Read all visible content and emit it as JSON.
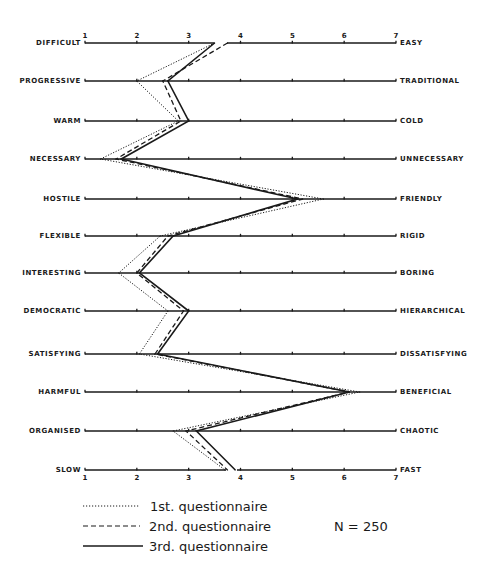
{
  "chart_data": {
    "type": "line",
    "title": "",
    "xlabel": "",
    "ylabel": "",
    "orientation": "semantic-differential",
    "scale": {
      "min": 1,
      "max": 7,
      "ticks": [
        "1",
        "2",
        "3",
        "4",
        "5",
        "6",
        "7"
      ]
    },
    "items": [
      {
        "left": "DIFFICULT",
        "right": "EASY"
      },
      {
        "left": "PROGRESSIVE",
        "right": "TRADITIONAL"
      },
      {
        "left": "WARM",
        "right": "COLD"
      },
      {
        "left": "NECESSARY",
        "right": "UNNECESSARY"
      },
      {
        "left": "HOSTILE",
        "right": "FRIENDLY"
      },
      {
        "left": "FLEXIBLE",
        "right": "RIGID"
      },
      {
        "left": "INTERESTING",
        "right": "BORING"
      },
      {
        "left": "DEMOCRATIC",
        "right": "HIERARCHICAL"
      },
      {
        "left": "SATISFYING",
        "right": "DISSATISFYING"
      },
      {
        "left": "HARMFUL",
        "right": "BENEFICIAL"
      },
      {
        "left": "ORGANISED",
        "right": "CHAOTIC"
      },
      {
        "left": "SLOW",
        "right": "FAST"
      }
    ],
    "series": [
      {
        "name": "1st. questionnaire",
        "style": "dotted",
        "values": [
          3.5,
          2.0,
          2.8,
          1.3,
          5.6,
          2.45,
          1.65,
          2.6,
          2.05,
          6.3,
          2.7,
          3.7
        ]
      },
      {
        "name": "2nd. questionnaire",
        "style": "dashed",
        "values": [
          3.75,
          2.5,
          2.85,
          1.6,
          5.2,
          2.6,
          2.0,
          2.9,
          2.35,
          6.1,
          2.95,
          3.75
        ]
      },
      {
        "name": "3rd. questionnaire",
        "style": "solid",
        "values": [
          3.5,
          2.6,
          3.0,
          1.7,
          5.1,
          2.7,
          2.05,
          3.0,
          2.4,
          6.1,
          3.15,
          3.9
        ]
      }
    ],
    "annotation": "N = 250",
    "legend": "bottom-left",
    "grid": false
  }
}
